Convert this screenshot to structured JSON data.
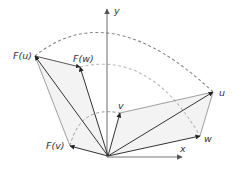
{
  "diagram": {
    "axes": {
      "x_label": "x",
      "y_label": "y"
    },
    "vectors": {
      "u": {
        "label": "u"
      },
      "v": {
        "label": "v"
      },
      "w": {
        "label": "w"
      },
      "Fu": {
        "label": "F(u)"
      },
      "Fv": {
        "label": "F(v)"
      },
      "Fw": {
        "label": "F(w)"
      }
    },
    "colors": {
      "arrow": "#333333",
      "thin_line": "#888888",
      "dashed_arc_outer": "#888888",
      "dashed_arc_inner": "#bbbbbb",
      "fill": "#f2f2f2"
    }
  }
}
